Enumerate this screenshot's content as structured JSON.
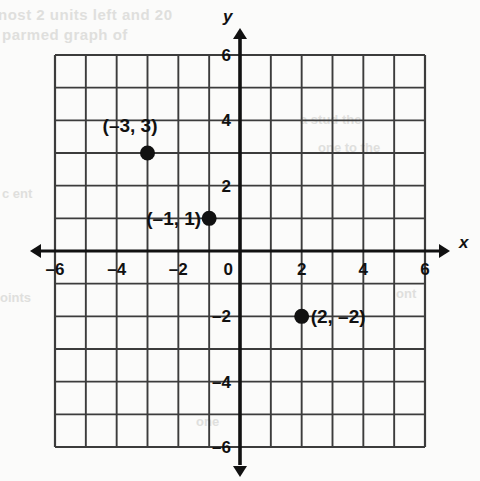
{
  "meta": {
    "background_color": "#fbfbfa",
    "ink_color": "#111111",
    "grid_color": "#3c3c3c",
    "axis_color": "#111111"
  },
  "chart_data": {
    "type": "scatter",
    "title": "",
    "xlabel": "x",
    "ylabel": "y",
    "xlim": [
      -6,
      6
    ],
    "ylim": [
      -6,
      6
    ],
    "grid": true,
    "grid_step": 1,
    "tick_step": 2,
    "legend": "none",
    "origin_label": "0",
    "x_ticks": [
      "–6",
      "–4",
      "–2",
      "0",
      "2",
      "4",
      "6"
    ],
    "x_tick_values": [
      -6,
      -4,
      -2,
      0,
      2,
      4,
      6
    ],
    "y_ticks": [
      "6",
      "4",
      "2",
      "–2",
      "–4",
      "–6"
    ],
    "y_tick_values": [
      6,
      4,
      2,
      -2,
      -4,
      -6
    ],
    "points": [
      {
        "x": -3,
        "y": 3,
        "label": "(–3, 3)",
        "label_position": "above-left"
      },
      {
        "x": -1,
        "y": 1,
        "label": "(–1, 1)",
        "label_position": "left"
      },
      {
        "x": 2,
        "y": -2,
        "label": "(2, –2)",
        "label_position": "right"
      }
    ]
  },
  "axes": {
    "x_axis_name": "x",
    "y_axis_name": "y",
    "arrows": [
      "left",
      "right",
      "up",
      "down"
    ]
  },
  "ghost_text": {
    "line1": "nost 2 units left and 20",
    "line2": "parmed graph of",
    "line3": "a stud the",
    "line4": "one to the",
    "line5": "c ent",
    "line6": "oints",
    "line7": "one",
    "line8": "ont"
  }
}
